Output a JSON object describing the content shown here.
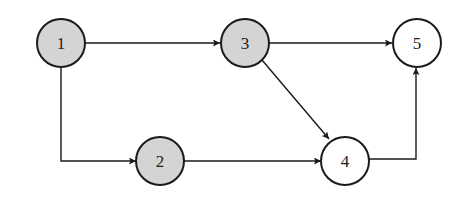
{
  "diagram": {
    "type": "directed-graph",
    "colors": {
      "shaded_fill": "#d4d4d4",
      "unshaded_fill": "#ffffff",
      "stroke": "#1a1a1a"
    },
    "nodes": [
      {
        "id": "1",
        "label": "1",
        "shaded": true
      },
      {
        "id": "2",
        "label": "2",
        "shaded": true
      },
      {
        "id": "3",
        "label": "3",
        "shaded": true
      },
      {
        "id": "4",
        "label": "4",
        "shaded": false
      },
      {
        "id": "5",
        "label": "5",
        "shaded": false
      }
    ],
    "edges": [
      {
        "from": "1",
        "to": "3"
      },
      {
        "from": "1",
        "to": "2"
      },
      {
        "from": "3",
        "to": "5"
      },
      {
        "from": "3",
        "to": "4"
      },
      {
        "from": "2",
        "to": "4"
      },
      {
        "from": "4",
        "to": "5"
      }
    ]
  }
}
